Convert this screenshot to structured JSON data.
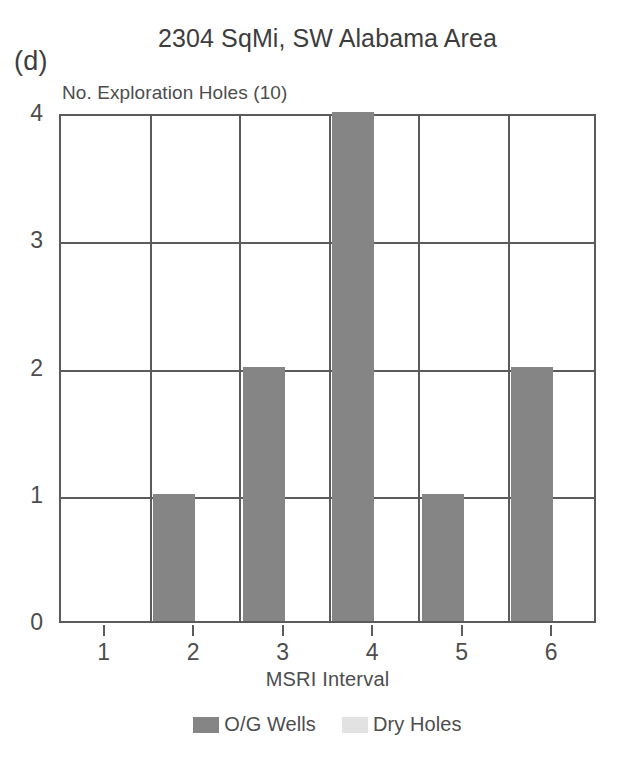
{
  "panel": {
    "label": "(d)"
  },
  "chart_data": {
    "type": "bar",
    "title": "2304 SqMi, SW Alabama Area",
    "xlabel": "MSRI Interval",
    "ylabel": "No. Exploration Holes (10)",
    "categories": [
      "1",
      "2",
      "3",
      "4",
      "5",
      "6"
    ],
    "series": [
      {
        "name": "O/G Wells",
        "color": "#858585",
        "values": [
          0,
          1,
          2,
          4,
          1,
          2
        ]
      },
      {
        "name": "Dry Holes",
        "color": "#e2e2e2",
        "values": [
          0,
          0,
          0,
          0,
          0,
          0
        ]
      }
    ],
    "ylim": [
      0,
      4
    ],
    "yticks": [
      "0",
      "1",
      "2",
      "3",
      "4"
    ],
    "xticks": [
      "1",
      "2",
      "3",
      "4",
      "5",
      "6"
    ],
    "grid": true,
    "legend_position": "bottom-center"
  },
  "legend": {
    "items": [
      {
        "label": "O/G Wells",
        "color": "#858585"
      },
      {
        "label": "Dry Holes",
        "color": "#e2e2e2"
      }
    ]
  },
  "colors": {
    "axis": "#5b5b5b",
    "text": "#4d4d4d",
    "background": "#ffffff"
  }
}
